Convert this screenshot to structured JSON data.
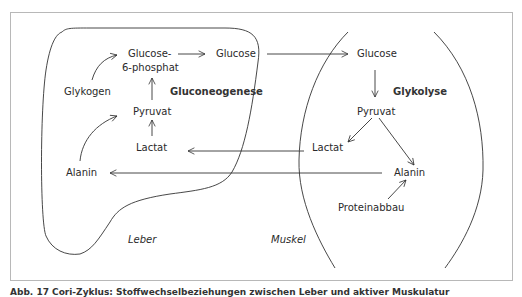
{
  "diagram": {
    "regions": {
      "liver": "Leber",
      "muscle": "Muskel"
    },
    "liver_nodes": {
      "glucose6p_line1": "Glucose-",
      "glucose6p_line2": "6-phosphat",
      "glucose": "Glucose",
      "glykogen": "Glykogen",
      "gluconeogenese": "Gluconeogenese",
      "pyruvat": "Pyruvat",
      "lactat": "Lactat",
      "alanin": "Alanin"
    },
    "muscle_nodes": {
      "glucose": "Glucose",
      "glykolyse": "Glykolyse",
      "pyruvat": "Pyruvat",
      "lactat": "Lactat",
      "alanin": "Alanin",
      "proteinabbau": "Proteinabbau"
    },
    "edges": [
      {
        "from": "Glykogen",
        "to": "Glucose-6-phosphat"
      },
      {
        "from": "Glucose-6-phosphat",
        "to": "Glucose (Leber)"
      },
      {
        "from": "Pyruvat (Leber)",
        "to": "Glucose-6-phosphat"
      },
      {
        "from": "Lactat (Leber)",
        "to": "Pyruvat (Leber)"
      },
      {
        "from": "Alanin (Leber)",
        "to": "Pyruvat (Leber)"
      },
      {
        "from": "Glucose (Leber)",
        "to": "Glucose (Muskel)"
      },
      {
        "from": "Glucose (Muskel)",
        "to": "Pyruvat (Muskel)"
      },
      {
        "from": "Pyruvat (Muskel)",
        "to": "Lactat (Muskel)"
      },
      {
        "from": "Pyruvat (Muskel)",
        "to": "Alanin (Muskel)"
      },
      {
        "from": "Proteinabbau",
        "to": "Alanin (Muskel)"
      },
      {
        "from": "Lactat (Muskel)",
        "to": "Lactat (Leber)"
      },
      {
        "from": "Alanin (Muskel)",
        "to": "Alanin (Leber)"
      }
    ]
  },
  "caption": "Abb. 17 Cori-Zyklus: Stoffwechselbeziehungen zwischen Leber und aktiver Muskulatur"
}
